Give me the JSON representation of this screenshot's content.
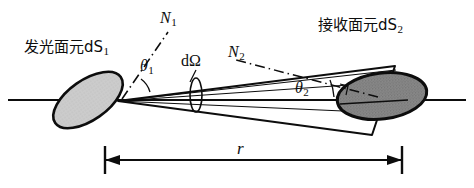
{
  "figure": {
    "kind": "optics-radiometry-geometry-diagram",
    "labels": {
      "source_surface": "发光面元dS",
      "source_surface_sub": "1",
      "receiver_surface": "接收面元dS",
      "receiver_surface_sub": "2",
      "normal_1": "N",
      "normal_1_sub": "1",
      "normal_2": "N",
      "normal_2_sub": "2",
      "solid_angle": "dΩ",
      "angle_1": "θ",
      "angle_1_sub": "1",
      "angle_2": "θ",
      "angle_2_sub": "2",
      "distance": "r"
    },
    "colors": {
      "ink": "#0d0d0d",
      "source_fill": "#c9c9c9",
      "receiver_fill": "#7d7d7d",
      "background": "#ffffff"
    },
    "geometry": {
      "source_ellipse": {
        "cx": 88,
        "cy": 100,
        "rx": 40,
        "ry": 20,
        "rotation_deg": -35
      },
      "receiver_ellipse": {
        "cx": 382,
        "cy": 96,
        "rx": 45,
        "ry": 23,
        "rotation_deg": -7
      },
      "solid_angle_ellipse": {
        "cx": 196,
        "cy": 95,
        "rx": 6,
        "ry": 17
      },
      "optical_axis": {
        "x1": 8,
        "y1": 100,
        "x2": 466,
        "y2": 100
      },
      "distance_dimension": {
        "x1": 105,
        "x2": 402,
        "y": 160
      }
    }
  }
}
